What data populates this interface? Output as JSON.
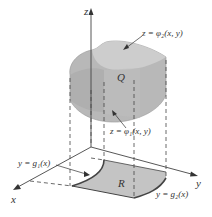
{
  "figure": {
    "axes": {
      "z": "z",
      "y": "y",
      "x": "x"
    },
    "labels": {
      "top_surface": "z = φ₂(x, y)",
      "bottom_surface": "z = φ₁(x, y)",
      "solid": "Q",
      "region": "R",
      "curve_g1": "y = g₁(x)",
      "curve_g2": "y = g₂(x)"
    },
    "colors": {
      "solid_fill": "#b8b8b8",
      "solid_top": "#c8c8c8",
      "region_fill": "#c4c4c4",
      "line": "#444444"
    }
  }
}
